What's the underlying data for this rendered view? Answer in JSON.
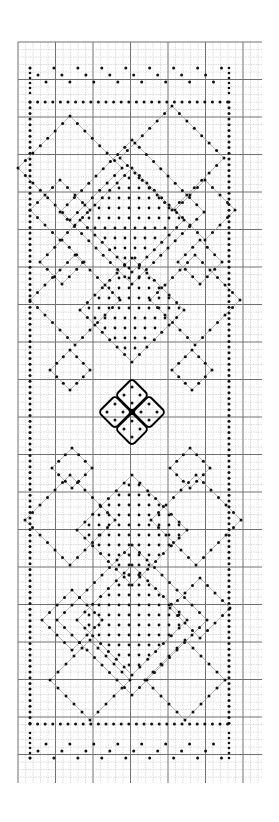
{
  "diagram": {
    "type": "bobbin-lace-pricking",
    "background": "#ffffff",
    "grid": {
      "x0": 18,
      "y0": 42,
      "x1": 262,
      "y1": 783,
      "cell": 7.5,
      "major_every": 5,
      "minor_color": "#b8b8b8",
      "major_color": "#707070"
    },
    "ink": "#111111",
    "guide_color": "#9a9a9a",
    "center": {
      "x": 132,
      "y": 412
    },
    "border": {
      "left_x": 30,
      "right_x": 229,
      "top_y": 102,
      "bottom_y": 724,
      "outer_top_y": 68,
      "outer_bottom_y": 758
    },
    "flower": {
      "petal_half": 17,
      "petals": [
        "top",
        "left",
        "right",
        "bottom"
      ]
    }
  }
}
